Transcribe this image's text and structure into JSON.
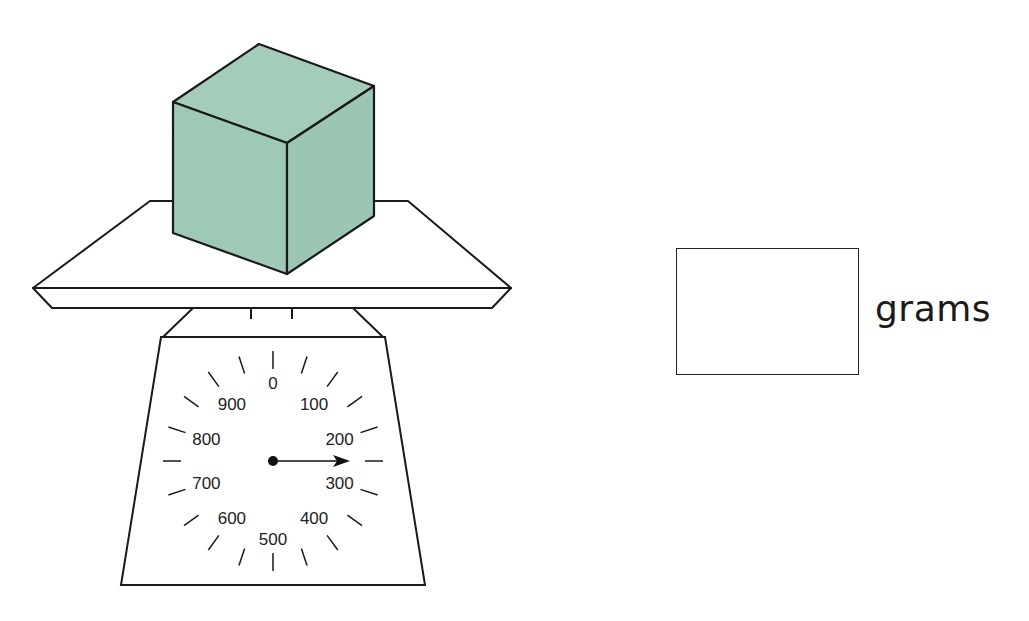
{
  "diagram": {
    "type": "kitchen-scale-reading",
    "object_on_scale": "cube",
    "colors": {
      "cube_fill": "#9ec9b6",
      "stroke": "#1a1a1a",
      "background": "#ffffff"
    },
    "dial": {
      "labels": [
        "0",
        "100",
        "200",
        "300",
        "400",
        "500",
        "600",
        "700",
        "800",
        "900"
      ],
      "unit_max": 1000,
      "pointer_reading": 250
    },
    "answer": {
      "value": "",
      "unit": "grams"
    }
  }
}
